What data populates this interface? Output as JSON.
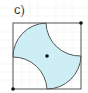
{
  "figure": {
    "label": "c)",
    "fill_color": "#cdeef5",
    "stroke_color": "#555555",
    "grid_color": "#ececec",
    "point_color": "#111111"
  }
}
